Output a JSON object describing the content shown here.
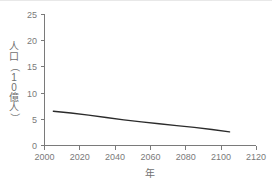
{
  "chart_data": {
    "type": "line",
    "title": "",
    "xlabel": "年",
    "ylabel": "人口（10億人）",
    "ylabel_chars": [
      "人",
      "口",
      "（",
      "1",
      "0",
      "億",
      "人",
      "）"
    ],
    "xlim": [
      2000,
      2120
    ],
    "ylim": [
      0,
      25
    ],
    "xticks": [
      2000,
      2020,
      2040,
      2060,
      2080,
      2100,
      2120
    ],
    "xtick_labels": [
      "2000",
      "2020",
      "2040",
      "2060",
      "2080",
      "2100",
      "2120"
    ],
    "yticks": [
      0,
      5,
      10,
      15,
      20,
      25
    ],
    "ytick_labels": [
      "0",
      "5",
      "10",
      "15",
      "20",
      "25"
    ],
    "grid": false,
    "legend": "none",
    "series": [
      {
        "name": "人口",
        "color": "#2b2b2b",
        "x": [
          2005,
          2015,
          2025,
          2035,
          2045,
          2055,
          2065,
          2075,
          2085,
          2095,
          2105
        ],
        "y": [
          6.55,
          6.2,
          5.8,
          5.35,
          4.9,
          4.5,
          4.15,
          3.8,
          3.45,
          3.05,
          2.6
        ]
      }
    ]
  },
  "axes": {
    "x_axis_name": "year-axis",
    "y_axis_name": "population-axis",
    "line_color": "#7a7a7a",
    "series_color": "#2b2b2b"
  }
}
